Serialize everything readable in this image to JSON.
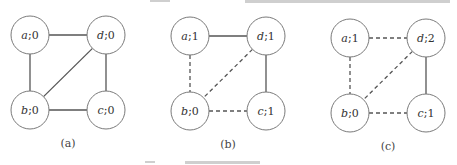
{
  "figure": {
    "panels": [
      {
        "id": "a",
        "caption": "(a)",
        "nodes": [
          {
            "id": "a",
            "label": "a;0",
            "var": "a",
            "val": "0",
            "cx": 30,
            "cy": 35
          },
          {
            "id": "d",
            "label": "d;0",
            "var": "d",
            "val": "0",
            "cx": 106,
            "cy": 35
          },
          {
            "id": "b",
            "label": "b;0",
            "var": "b",
            "val": "0",
            "cx": 30,
            "cy": 110
          },
          {
            "id": "c",
            "label": "c;0",
            "var": "c",
            "val": "0",
            "cx": 106,
            "cy": 110
          }
        ],
        "edges": [
          {
            "from": "a",
            "to": "d",
            "style": "solid"
          },
          {
            "from": "a",
            "to": "b",
            "style": "solid"
          },
          {
            "from": "d",
            "to": "b",
            "style": "solid"
          },
          {
            "from": "d",
            "to": "c",
            "style": "solid"
          },
          {
            "from": "b",
            "to": "c",
            "style": "solid"
          }
        ]
      },
      {
        "id": "b",
        "caption": "(b)",
        "nodes": [
          {
            "id": "a",
            "label": "a;1",
            "var": "a",
            "val": "1",
            "cx": 190,
            "cy": 36
          },
          {
            "id": "d",
            "label": "d;1",
            "var": "d",
            "val": "1",
            "cx": 266,
            "cy": 36
          },
          {
            "id": "b",
            "label": "b;0",
            "var": "b",
            "val": "0",
            "cx": 190,
            "cy": 111
          },
          {
            "id": "c",
            "label": "c;1",
            "var": "c",
            "val": "1",
            "cx": 266,
            "cy": 111
          }
        ],
        "edges": [
          {
            "from": "a",
            "to": "d",
            "style": "solid"
          },
          {
            "from": "a",
            "to": "b",
            "style": "dashed"
          },
          {
            "from": "d",
            "to": "b",
            "style": "dashed"
          },
          {
            "from": "d",
            "to": "c",
            "style": "solid"
          },
          {
            "from": "b",
            "to": "c",
            "style": "dashed"
          }
        ]
      },
      {
        "id": "c",
        "caption": "(c)",
        "nodes": [
          {
            "id": "a",
            "label": "a;1",
            "var": "a",
            "val": "1",
            "cx": 350,
            "cy": 38
          },
          {
            "id": "d",
            "label": "d;2",
            "var": "d",
            "val": "2",
            "cx": 426,
            "cy": 38
          },
          {
            "id": "b",
            "label": "b;0",
            "var": "b",
            "val": "0",
            "cx": 350,
            "cy": 113
          },
          {
            "id": "c",
            "label": "c;1",
            "var": "c",
            "val": "1",
            "cx": 426,
            "cy": 113
          }
        ],
        "edges": [
          {
            "from": "a",
            "to": "d",
            "style": "dashed"
          },
          {
            "from": "a",
            "to": "b",
            "style": "dashed"
          },
          {
            "from": "d",
            "to": "b",
            "style": "dashed"
          },
          {
            "from": "d",
            "to": "c",
            "style": "solid"
          },
          {
            "from": "b",
            "to": "c",
            "style": "dashed"
          }
        ]
      }
    ],
    "node_radius": 19,
    "colors": {
      "node_stroke": "#7a7a7a",
      "edge": "#555555",
      "text": "#333333"
    }
  }
}
